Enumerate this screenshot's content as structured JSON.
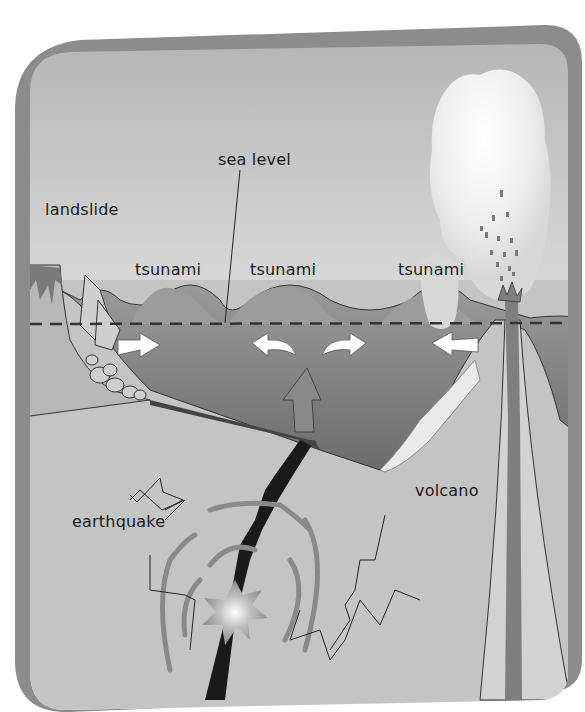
{
  "diagram": {
    "labels": {
      "sea_level": "sea level",
      "landslide": "landslide",
      "tsunami_1": "tsunami",
      "tsunami_2": "tsunami",
      "tsunami_3": "tsunami",
      "earthquake": "earthquake",
      "volcano": "volcano"
    },
    "colors": {
      "frame": "#8a8a8a",
      "sky_top": "#b4b4b4",
      "sky_bottom": "#f4f4f4",
      "sea": "#7a7a7a",
      "ground": "#c6c6c6",
      "fault": "#1a1a1a",
      "arrows": "#ffffff",
      "text": "#1a1a1a"
    }
  }
}
